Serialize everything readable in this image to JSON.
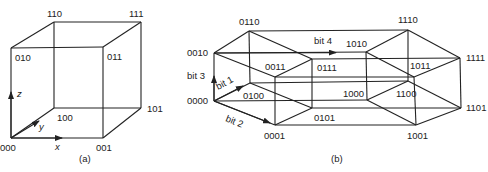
{
  "figure": {
    "panel_a": {
      "caption": "(a)",
      "title": "3-cube",
      "vertices": [
        {
          "label": "000",
          "x": 11,
          "y": 138,
          "lx": 0,
          "ly": 151
        },
        {
          "label": "001",
          "x": 103,
          "y": 138,
          "lx": 96,
          "ly": 151
        },
        {
          "label": "010",
          "x": 11,
          "y": 48,
          "lx": 15,
          "ly": 61
        },
        {
          "label": "011",
          "x": 103,
          "y": 47,
          "lx": 107,
          "ly": 60
        },
        {
          "label": "100",
          "x": 54,
          "y": 108,
          "lx": 57,
          "ly": 121
        },
        {
          "label": "101",
          "x": 141,
          "y": 108,
          "lx": 147,
          "ly": 112
        },
        {
          "label": "110",
          "x": 54,
          "y": 22,
          "lx": 47,
          "ly": 17
        },
        {
          "label": "111",
          "x": 141,
          "y": 22,
          "lx": 129,
          "ly": 17
        }
      ],
      "axes": [
        {
          "label": "x",
          "lx": 55,
          "ly": 150
        },
        {
          "label": "y",
          "lx": 39,
          "ly": 130
        },
        {
          "label": "z",
          "lx": 17,
          "ly": 97
        }
      ]
    },
    "panel_b": {
      "caption": "(b)",
      "title": "4-cube (hypercube)",
      "vertices": [
        {
          "label": "0000",
          "x": 214,
          "y": 101,
          "lx": 187,
          "ly": 104
        },
        {
          "label": "0001",
          "x": 275,
          "y": 125,
          "lx": 264,
          "ly": 139
        },
        {
          "label": "0010",
          "x": 214,
          "y": 53,
          "lx": 187,
          "ly": 56
        },
        {
          "label": "0011",
          "x": 275,
          "y": 77,
          "lx": 265,
          "ly": 70
        },
        {
          "label": "0100",
          "x": 250,
          "y": 83,
          "lx": 243,
          "ly": 99
        },
        {
          "label": "0101",
          "x": 312,
          "y": 108,
          "lx": 314,
          "ly": 121
        },
        {
          "label": "0110",
          "x": 249,
          "y": 31,
          "lx": 239,
          "ly": 25
        },
        {
          "label": "0111",
          "x": 312,
          "y": 59,
          "lx": 317,
          "ly": 71
        },
        {
          "label": "1000",
          "x": 367,
          "y": 100,
          "lx": 343,
          "ly": 97
        },
        {
          "label": "1001",
          "x": 416,
          "y": 125,
          "lx": 407,
          "ly": 139
        },
        {
          "label": "1010",
          "x": 366,
          "y": 52,
          "lx": 346,
          "ly": 47
        },
        {
          "label": "1011",
          "x": 414,
          "y": 77,
          "lx": 410,
          "ly": 69
        },
        {
          "label": "1100",
          "x": 408,
          "y": 81,
          "lx": 396,
          "ly": 97
        },
        {
          "label": "1101",
          "x": 461,
          "y": 108,
          "lx": 466,
          "ly": 111
        },
        {
          "label": "1110",
          "x": 408,
          "y": 30,
          "lx": 398,
          "ly": 23
        },
        {
          "label": "1111",
          "x": 460,
          "y": 58,
          "lx": 466,
          "ly": 61
        }
      ],
      "dimension_labels": [
        {
          "label": "bit 1",
          "lx": 218,
          "ly": 90,
          "rotate": -28
        },
        {
          "label": "bit 2",
          "lx": 225,
          "ly": 121,
          "rotate": 22
        },
        {
          "label": "bit 3",
          "lx": 187,
          "ly": 79,
          "rotate": 0
        },
        {
          "label": "bit 4",
          "lx": 314,
          "ly": 44,
          "rotate": 0
        }
      ]
    }
  }
}
